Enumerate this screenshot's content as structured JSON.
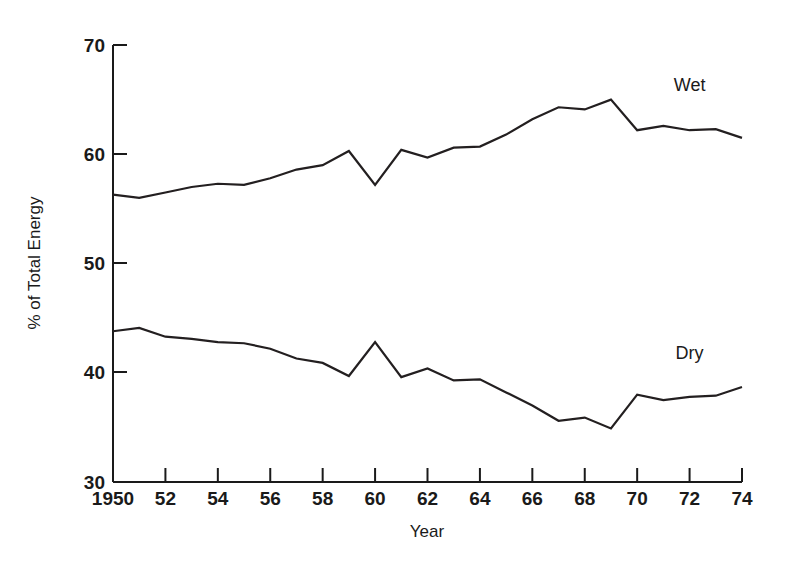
{
  "chart_data": {
    "type": "line",
    "title": "",
    "xlabel": "Year",
    "ylabel": "% of Total Energy",
    "xlim": [
      1950,
      1974
    ],
    "ylim": [
      30,
      70
    ],
    "grid": false,
    "legend_position": "inline-right",
    "x_tick_labels": [
      "1950",
      "52",
      "54",
      "56",
      "58",
      "60",
      "62",
      "64",
      "66",
      "68",
      "70",
      "72",
      "74"
    ],
    "x_tick_values": [
      1950,
      1952,
      1954,
      1956,
      1958,
      1960,
      1962,
      1964,
      1966,
      1968,
      1970,
      1972,
      1974
    ],
    "y_tick_labels": [
      "30",
      "40",
      "50",
      "60",
      "70"
    ],
    "y_tick_values": [
      30,
      40,
      50,
      60,
      70
    ],
    "x": [
      1950,
      1951,
      1952,
      1953,
      1954,
      1955,
      1956,
      1957,
      1958,
      1959,
      1960,
      1961,
      1962,
      1963,
      1964,
      1965,
      1966,
      1967,
      1968,
      1969,
      1970,
      1971,
      1972,
      1973,
      1974
    ],
    "series": [
      {
        "name": "Wet",
        "values": [
          56.3,
          56.0,
          56.5,
          57.0,
          57.3,
          57.2,
          57.8,
          58.6,
          59.0,
          60.3,
          57.2,
          60.4,
          59.7,
          60.6,
          60.7,
          61.8,
          63.2,
          64.3,
          64.1,
          65.0,
          62.2,
          62.6,
          62.2,
          62.3,
          61.5
        ]
      },
      {
        "name": "Dry",
        "values": [
          43.8,
          44.1,
          43.3,
          43.1,
          42.8,
          42.7,
          42.2,
          41.3,
          40.9,
          39.7,
          42.8,
          39.6,
          40.4,
          39.3,
          39.4,
          38.2,
          37.0,
          35.6,
          35.9,
          34.9,
          38.0,
          37.5,
          37.8,
          37.9,
          38.7
        ]
      }
    ],
    "annotations": [
      {
        "text": "Wet",
        "x": 1972.0,
        "y": 65.8
      },
      {
        "text": "Dry",
        "x": 1972.0,
        "y": 41.3
      }
    ]
  },
  "axes": {
    "x_title": "Year",
    "y_title": "% of Total Energy"
  }
}
